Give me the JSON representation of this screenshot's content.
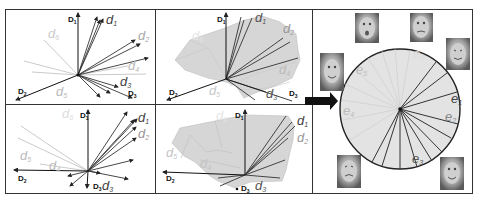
{
  "figure": {
    "panels": [
      {
        "id": "top-left",
        "description": "vector diagram",
        "axes": [
          "D1",
          "D2",
          "D3"
        ],
        "vector_labels": [
          {
            "text": "d",
            "sub": "1"
          },
          {
            "text": "d",
            "sub": "2"
          },
          {
            "text": "d",
            "sub": "3"
          },
          {
            "text": "d",
            "sub": "4"
          },
          {
            "text": "d",
            "sub": "5"
          },
          {
            "text": "d",
            "sub": "6"
          }
        ]
      },
      {
        "id": "top-middle",
        "description": "vector diagram with shaded surface",
        "axes": [
          "D1",
          "D2",
          "D3"
        ],
        "vector_labels": [
          {
            "text": "d",
            "sub": "1"
          },
          {
            "text": "d",
            "sub": "2"
          },
          {
            "text": "d",
            "sub": "3"
          },
          {
            "text": "d",
            "sub": "4"
          },
          {
            "text": "d",
            "sub": "5"
          },
          {
            "text": "d",
            "sub": "6"
          }
        ]
      },
      {
        "id": "bottom-left",
        "description": "vector diagram",
        "axes": [
          "D1",
          "D2",
          "D3"
        ],
        "vector_labels": [
          {
            "text": "d",
            "sub": "1"
          },
          {
            "text": "d",
            "sub": "2"
          },
          {
            "text": "d",
            "sub": "3"
          },
          {
            "text": "d",
            "sub": "4"
          },
          {
            "text": "d",
            "sub": "5"
          },
          {
            "text": "d",
            "sub": "6"
          }
        ]
      },
      {
        "id": "bottom-middle",
        "description": "vector diagram with shaded surface",
        "axes": [
          "D1",
          "D2",
          "D3"
        ],
        "vector_labels": [
          {
            "text": "d",
            "sub": "1"
          },
          {
            "text": "d",
            "sub": "2"
          },
          {
            "text": "d",
            "sub": "3"
          },
          {
            "text": "d",
            "sub": "4"
          },
          {
            "text": "d",
            "sub": "5"
          },
          {
            "text": "d",
            "sub": "6"
          }
        ]
      },
      {
        "id": "right",
        "description": "circular disk embedding with face thumbnails",
        "vector_labels": [
          {
            "text": "e",
            "sub": "1"
          },
          {
            "text": "e",
            "sub": "2"
          },
          {
            "text": "e",
            "sub": "3"
          },
          {
            "text": "e",
            "sub": "4"
          },
          {
            "text": "e",
            "sub": "5"
          },
          {
            "text": "e",
            "sub": "6"
          }
        ],
        "face_thumbnails": 6
      }
    ],
    "arrow": "right-arrow",
    "colors": {
      "frame": "#333333",
      "vector_dark": "#222222",
      "vector_light": "#bbbbbb",
      "surface": "#d9d9d9",
      "disk_fill": "#e4e4e4",
      "arrow": "#111111",
      "label_dark": "#444444",
      "label_light": "#bdbdbd"
    }
  }
}
